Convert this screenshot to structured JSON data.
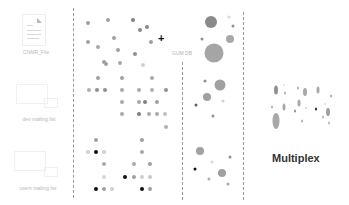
{
  "sources": [
    {
      "label": "CNMR_File",
      "icon": "document-icon"
    },
    {
      "label": "dev mailing list",
      "icon": "mailing-list-icon"
    },
    {
      "label": "users mailing list",
      "icon": "mailing-list-icon"
    }
  ],
  "operator": {
    "symbol": "+"
  },
  "db": {
    "label": "GUM DB"
  },
  "result": {
    "title": "Multiplex"
  },
  "colors": {
    "dash": "#9a9a9a",
    "dot_light": "#c8c8c8",
    "dot_mid": "#999999",
    "dot_dark": "#222222",
    "title": "#333333"
  },
  "layers": [
    {
      "name": "layer-1",
      "dots": [
        {
          "x": 88,
          "y": 23,
          "r": 2,
          "c": "#a0a0a0"
        },
        {
          "x": 108,
          "y": 20,
          "r": 2,
          "c": "#a0a0a0"
        },
        {
          "x": 133,
          "y": 20,
          "r": 2,
          "c": "#808080"
        },
        {
          "x": 147,
          "y": 27,
          "r": 2,
          "c": "#888888"
        },
        {
          "x": 140,
          "y": 30,
          "r": 2,
          "c": "#888888"
        },
        {
          "x": 114,
          "y": 38,
          "r": 2,
          "c": "#a0a0a0"
        },
        {
          "x": 88,
          "y": 42,
          "r": 2,
          "c": "#a0a0a0"
        },
        {
          "x": 98,
          "y": 47,
          "r": 2,
          "c": "#a8a8a8"
        },
        {
          "x": 118,
          "y": 50,
          "r": 2,
          "c": "#a0a0a0"
        },
        {
          "x": 135,
          "y": 54,
          "r": 2,
          "c": "#909090"
        },
        {
          "x": 104,
          "y": 62,
          "r": 2,
          "c": "#a0a0a0"
        },
        {
          "x": 106,
          "y": 64,
          "r": 2,
          "c": "#a0a0a0"
        },
        {
          "x": 120,
          "y": 63,
          "r": 2,
          "c": "#a8a8a8"
        },
        {
          "x": 143,
          "y": 65,
          "r": 2,
          "c": "#d0d0d0"
        },
        {
          "x": 151,
          "y": 42,
          "r": 2,
          "c": "#a0a0a0"
        }
      ],
      "ovals": [
        {
          "x": 211,
          "y": 22,
          "w": 12,
          "h": 12,
          "c": "#8a8a8a"
        },
        {
          "x": 229,
          "y": 17,
          "w": 3,
          "h": 3,
          "c": "#d8d8d8"
        },
        {
          "x": 233,
          "y": 26,
          "w": 3,
          "h": 3,
          "c": "#909090"
        },
        {
          "x": 202,
          "y": 39,
          "w": 3,
          "h": 3,
          "c": "#909090"
        },
        {
          "x": 230,
          "y": 39,
          "w": 8,
          "h": 8,
          "c": "#a8a8a8"
        },
        {
          "x": 214,
          "y": 53,
          "w": 19,
          "h": 19,
          "c": "#a5a5a5"
        }
      ]
    },
    {
      "name": "layer-2",
      "dots": [
        {
          "x": 98,
          "y": 78,
          "r": 2,
          "c": "#a0a0a0"
        },
        {
          "x": 122,
          "y": 78,
          "r": 2,
          "c": "#a0a0a0"
        },
        {
          "x": 152,
          "y": 78,
          "r": 2,
          "c": "#a8a8a8"
        },
        {
          "x": 89,
          "y": 90,
          "r": 2,
          "c": "#b0b0b0"
        },
        {
          "x": 97,
          "y": 90,
          "r": 2,
          "c": "#909090"
        },
        {
          "x": 105,
          "y": 90,
          "r": 2,
          "c": "#909090"
        },
        {
          "x": 122,
          "y": 90,
          "r": 2,
          "c": "#a8a8a8"
        },
        {
          "x": 139,
          "y": 90,
          "r": 2,
          "c": "#a8a8a8"
        },
        {
          "x": 152,
          "y": 90,
          "r": 2,
          "c": "#b0b0b0"
        },
        {
          "x": 166,
          "y": 90,
          "r": 2,
          "c": "#909090"
        },
        {
          "x": 122,
          "y": 102,
          "r": 2,
          "c": "#a8a8a8"
        },
        {
          "x": 139,
          "y": 102,
          "r": 2,
          "c": "#a8a8a8"
        },
        {
          "x": 145,
          "y": 102,
          "r": 2,
          "c": "#808080"
        },
        {
          "x": 157,
          "y": 102,
          "r": 2,
          "c": "#a0a0a0"
        },
        {
          "x": 122,
          "y": 114,
          "r": 2,
          "c": "#a8a8a8"
        },
        {
          "x": 139,
          "y": 114,
          "r": 2,
          "c": "#808080"
        },
        {
          "x": 149,
          "y": 114,
          "r": 2,
          "c": "#a8a8a8"
        },
        {
          "x": 157,
          "y": 114,
          "r": 2,
          "c": "#a8a8a8"
        },
        {
          "x": 165,
          "y": 114,
          "r": 2,
          "c": "#c0c0c0"
        },
        {
          "x": 166,
          "y": 127,
          "r": 2,
          "c": "#b0b0b0"
        }
      ],
      "ovals": [
        {
          "x": 205,
          "y": 81,
          "w": 3,
          "h": 3,
          "c": "#909090"
        },
        {
          "x": 220,
          "y": 85,
          "w": 11,
          "h": 11,
          "c": "#a0a0a0"
        },
        {
          "x": 207,
          "y": 97,
          "w": 8,
          "h": 8,
          "c": "#a0a0a0"
        },
        {
          "x": 223,
          "y": 101,
          "w": 3,
          "h": 3,
          "c": "#d0d0d0"
        },
        {
          "x": 196,
          "y": 105,
          "w": 3,
          "h": 3,
          "c": "#606060"
        },
        {
          "x": 213,
          "y": 116,
          "w": 3,
          "h": 3,
          "c": "#909090"
        }
      ]
    },
    {
      "name": "layer-3",
      "dots": [
        {
          "x": 96,
          "y": 140,
          "r": 2,
          "c": "#a0a0a0"
        },
        {
          "x": 142,
          "y": 140,
          "r": 2,
          "c": "#a0a0a0"
        },
        {
          "x": 88,
          "y": 152,
          "r": 2,
          "c": "#d0d0d0"
        },
        {
          "x": 96,
          "y": 152,
          "r": 2,
          "c": "#111111"
        },
        {
          "x": 104,
          "y": 152,
          "r": 2,
          "c": "#d0d0d0"
        },
        {
          "x": 142,
          "y": 152,
          "r": 2,
          "c": "#a8a8a8"
        },
        {
          "x": 104,
          "y": 164,
          "r": 2,
          "c": "#a8a8a8"
        },
        {
          "x": 134,
          "y": 164,
          "r": 2,
          "c": "#a8a8a8"
        },
        {
          "x": 150,
          "y": 164,
          "r": 2,
          "c": "#a0a0a0"
        },
        {
          "x": 104,
          "y": 177,
          "r": 2,
          "c": "#d8d8d8"
        },
        {
          "x": 125,
          "y": 177,
          "r": 2,
          "c": "#111111"
        },
        {
          "x": 134,
          "y": 177,
          "r": 2,
          "c": "#a0a0a0"
        },
        {
          "x": 142,
          "y": 177,
          "r": 2,
          "c": "#d0d0d0"
        },
        {
          "x": 150,
          "y": 177,
          "r": 2,
          "c": "#c8c8c8"
        },
        {
          "x": 96,
          "y": 189,
          "r": 2,
          "c": "#111111"
        },
        {
          "x": 104,
          "y": 189,
          "r": 2,
          "c": "#a0a0a0"
        },
        {
          "x": 112,
          "y": 189,
          "r": 2,
          "c": "#d0d0d0"
        },
        {
          "x": 142,
          "y": 189,
          "r": 2,
          "c": "#111111"
        },
        {
          "x": 150,
          "y": 189,
          "r": 2,
          "c": "#a0a0a0"
        }
      ],
      "ovals": [
        {
          "x": 200,
          "y": 151,
          "w": 8,
          "h": 8,
          "c": "#a0a0a0"
        },
        {
          "x": 230,
          "y": 157,
          "w": 3,
          "h": 3,
          "c": "#909090"
        },
        {
          "x": 212,
          "y": 162,
          "w": 3,
          "h": 3,
          "c": "#d8d8d8"
        },
        {
          "x": 195,
          "y": 169,
          "w": 3,
          "h": 3,
          "c": "#111111"
        },
        {
          "x": 222,
          "y": 173,
          "w": 8,
          "h": 8,
          "c": "#a0a0a0"
        },
        {
          "x": 209,
          "y": 179,
          "w": 3,
          "h": 3,
          "c": "#b0b0b0"
        },
        {
          "x": 228,
          "y": 184,
          "w": 3,
          "h": 3,
          "c": "#a8a8a8"
        }
      ]
    }
  ],
  "multiplex": {
    "ovals": [
      {
        "x": 276,
        "y": 90,
        "w": 4,
        "h": 9,
        "c": "#909090"
      },
      {
        "x": 284,
        "y": 85,
        "w": 2,
        "h": 2,
        "c": "#e0e0e0"
      },
      {
        "x": 285,
        "y": 93,
        "w": 2,
        "h": 3,
        "c": "#b0b0b0"
      },
      {
        "x": 298,
        "y": 88,
        "w": 2,
        "h": 3,
        "c": "#b0b0b0"
      },
      {
        "x": 305,
        "y": 92,
        "w": 4,
        "h": 8,
        "c": "#a8a8a8"
      },
      {
        "x": 318,
        "y": 90,
        "w": 3,
        "h": 7,
        "c": "#a8a8a8"
      },
      {
        "x": 331,
        "y": 96,
        "w": 2,
        "h": 3,
        "c": "#b0b0b0"
      },
      {
        "x": 272,
        "y": 107,
        "w": 2,
        "h": 3,
        "c": "#b8b8b8"
      },
      {
        "x": 284,
        "y": 107,
        "w": 3,
        "h": 7,
        "c": "#a8a8a8"
      },
      {
        "x": 299,
        "y": 103,
        "w": 3,
        "h": 7,
        "c": "#a8a8a8"
      },
      {
        "x": 295,
        "y": 111,
        "w": 2,
        "h": 3,
        "c": "#909090"
      },
      {
        "x": 306,
        "y": 108,
        "w": 2,
        "h": 2,
        "c": "#d0d0d0"
      },
      {
        "x": 316,
        "y": 109,
        "w": 2,
        "h": 3,
        "c": "#222222"
      },
      {
        "x": 325,
        "y": 104,
        "w": 2,
        "h": 2,
        "c": "#e0e0e0"
      },
      {
        "x": 328,
        "y": 112,
        "w": 4,
        "h": 8,
        "c": "#a0a0a0"
      },
      {
        "x": 276,
        "y": 121,
        "w": 7,
        "h": 16,
        "c": "#a8a8a8"
      },
      {
        "x": 302,
        "y": 121,
        "w": 2,
        "h": 3,
        "c": "#b0b0b0"
      },
      {
        "x": 323,
        "y": 117,
        "w": 2,
        "h": 3,
        "c": "#b8b8b8"
      },
      {
        "x": 329,
        "y": 123,
        "w": 2,
        "h": 3,
        "c": "#b8b8b8"
      }
    ]
  }
}
